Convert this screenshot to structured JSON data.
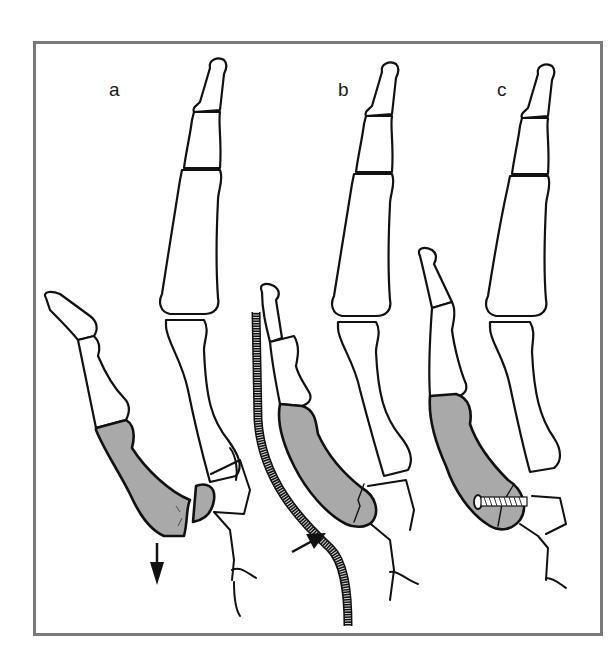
{
  "figure": {
    "panels": [
      {
        "id": "a",
        "label": "a",
        "description": "Displaced fracture of metacarpal base with volar displacement",
        "arrow": "downward force arrow"
      },
      {
        "id": "b",
        "label": "b",
        "description": "Closed reduction with curved splint and dorsal pressure",
        "arrow": "pressure arrow toward splint"
      },
      {
        "id": "c",
        "label": "c",
        "description": "Fixation with transverse screw across fracture"
      }
    ],
    "colors": {
      "frame": "#7a7a7a",
      "bone_outline": "#111111",
      "shaded_bone": "#a9a9a9",
      "splint_fill": "#d9d9d9",
      "background": "#ffffff"
    }
  }
}
